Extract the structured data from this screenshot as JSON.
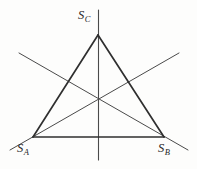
{
  "figure": {
    "name": "equilateral-triangle-symmetry-axes",
    "background_color": "#fdfdfc",
    "triangle_stroke_color": "#2f2f2f",
    "axis_stroke_color": "#4a4a4a",
    "label_color": "#262626",
    "labels": {
      "vertex_a": {
        "base": "S",
        "sub": "A"
      },
      "vertex_b": {
        "base": "S",
        "sub": "B"
      },
      "vertex_c": {
        "base": "S",
        "sub": "C"
      }
    }
  },
  "chart_data": {
    "type": "diagram",
    "title": "",
    "xlabel": "",
    "ylabel": "",
    "points": {
      "S_A": [
        33,
        137
      ],
      "S_B": [
        164,
        137
      ],
      "S_C": [
        98,
        35
      ],
      "centroid": [
        98.5,
        103
      ]
    },
    "segments": [
      {
        "name": "side-ab",
        "from": "S_A",
        "to": "S_B",
        "x1": 33,
        "y1": 137,
        "x2": 164,
        "y2": 137,
        "weight": 1.7
      },
      {
        "name": "side-ac",
        "from": "S_A",
        "to": "S_C",
        "x1": 33,
        "y1": 137,
        "x2": 98,
        "y2": 35,
        "weight": 1.7
      },
      {
        "name": "side-bc",
        "from": "S_B",
        "to": "S_C",
        "x1": 164,
        "y1": 137,
        "x2": 98,
        "y2": 35,
        "weight": 1.7
      }
    ],
    "axes": [
      {
        "name": "axis-vertical-through-sc",
        "x1": 98.5,
        "y1": 10,
        "x2": 98.5,
        "y2": 160,
        "weight": 1.1
      },
      {
        "name": "axis-diagonal-from-upper-left",
        "x1": 19,
        "y1": 53,
        "x2": 188,
        "y2": 150,
        "weight": 1.0
      },
      {
        "name": "axis-diagonal-from-upper-right",
        "x1": 179,
        "y1": 53,
        "x2": 10,
        "y2": 150,
        "weight": 1.0
      }
    ],
    "grid": false,
    "legend": null
  }
}
